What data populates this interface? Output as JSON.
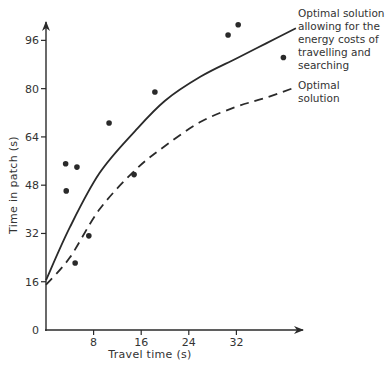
{
  "chart_data": {
    "type": "scatter",
    "title": "",
    "xlabel": "Travel time (s)",
    "ylabel": "Time in patch (s)",
    "xlim": [
      0,
      42
    ],
    "ylim": [
      0,
      104
    ],
    "xticks": [
      8,
      16,
      24,
      32
    ],
    "yticks": [
      0,
      16,
      32,
      48,
      64,
      80,
      96
    ],
    "grid": false,
    "legend_position": "right, annotations at curve ends",
    "points": [
      {
        "x": 3.3,
        "y": 55.1
      },
      {
        "x": 5.2,
        "y": 54.0
      },
      {
        "x": 3.4,
        "y": 46.1
      },
      {
        "x": 10.6,
        "y": 68.6
      },
      {
        "x": 18.3,
        "y": 78.9
      },
      {
        "x": 14.8,
        "y": 51.5
      },
      {
        "x": 7.2,
        "y": 31.2
      },
      {
        "x": 4.9,
        "y": 22.2
      },
      {
        "x": 30.6,
        "y": 97.8
      },
      {
        "x": 32.3,
        "y": 101.2
      },
      {
        "x": 39.9,
        "y": 90.3
      }
    ],
    "series": [
      {
        "name": "Optimal solution allowing for the energy costs of travelling and searching",
        "style": "solid",
        "x": [
          0,
          4,
          9,
          15,
          20,
          26,
          32,
          37,
          42
        ],
        "y": [
          16.5,
          34,
          52,
          66,
          76,
          84,
          90,
          95,
          100
        ]
      },
      {
        "name": "Optimal solution",
        "style": "dashed",
        "x": [
          0,
          4,
          9,
          15,
          20,
          26,
          32,
          37,
          42
        ],
        "y": [
          15,
          24,
          40,
          53,
          61,
          69,
          74,
          77,
          80.5
        ]
      }
    ],
    "annotations": [
      {
        "lines": [
          "Optimal solution",
          "allowing for the",
          "energy costs of",
          "travelling and",
          "searching"
        ]
      },
      {
        "lines": [
          "Optimal",
          "solution"
        ]
      }
    ]
  },
  "axes": {
    "x_label": "Travel time (s)",
    "y_label": "Time in patch (s)",
    "x_ticks": [
      "8",
      "16",
      "24",
      "32"
    ],
    "y_ticks": [
      "0",
      "16",
      "32",
      "48",
      "64",
      "80",
      "96"
    ]
  },
  "legend": {
    "solid": [
      "Optimal solution",
      "allowing for the",
      "energy costs of",
      "travelling and",
      "searching"
    ],
    "dashed": [
      "Optimal",
      "solution"
    ]
  }
}
